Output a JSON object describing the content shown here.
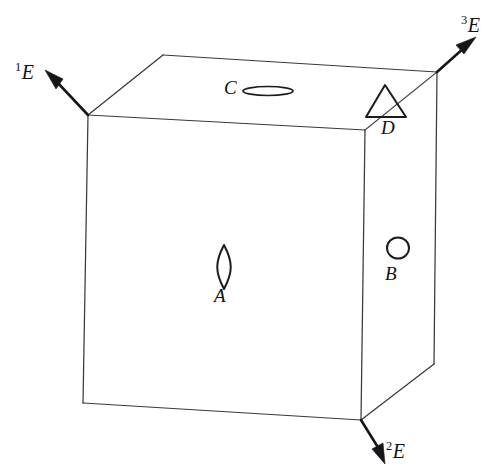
{
  "figure": {
    "type": "line-drawing",
    "background_color": "#ffffff",
    "line_color": "#39393c",
    "axis_color": "#16161a",
    "marker_color": "#1c1c20"
  },
  "axes": [
    {
      "id": "E1",
      "label_prefix": "1",
      "label_base": "E",
      "direction": "up-left",
      "origin_corner": "top-left-front"
    },
    {
      "id": "E2",
      "label_prefix": "2",
      "label_base": "E",
      "direction": "down",
      "origin_corner": "bottom-right-front"
    },
    {
      "id": "E3",
      "label_prefix": "3",
      "label_base": "E",
      "direction": "up-right",
      "origin_corner": "top-right-back"
    }
  ],
  "markers": [
    {
      "id": "A",
      "label": "A",
      "shape": "vertical-lens",
      "face": "front",
      "label_position": "below"
    },
    {
      "id": "B",
      "label": "B",
      "shape": "circle",
      "face": "right",
      "label_position": "below"
    },
    {
      "id": "C",
      "label": "C",
      "shape": "horizontal-ellipse",
      "face": "top",
      "label_position": "left"
    },
    {
      "id": "D",
      "label": "D",
      "shape": "triangle",
      "face": "top",
      "label_position": "below"
    }
  ],
  "cube": {
    "visible_faces": [
      "front",
      "right",
      "top"
    ],
    "vertices": {
      "front_top_left": [
        88,
        115
      ],
      "front_top_right": [
        365,
        130
      ],
      "front_bottom_left": [
        83,
        403
      ],
      "front_bottom_right": [
        361,
        420
      ],
      "back_top_left": [
        163,
        55
      ],
      "back_top_right": [
        437,
        72
      ],
      "back_bottom_right": [
        434,
        364
      ]
    }
  }
}
